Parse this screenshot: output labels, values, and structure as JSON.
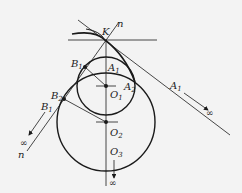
{
  "diagram": {
    "type": "geometry",
    "labels": {
      "K": "K",
      "n_top": "n",
      "n_bottom": "n",
      "A1_small": {
        "base": "A",
        "sub": "1"
      },
      "A2": {
        "base": "A",
        "sub": "2"
      },
      "A1_far": {
        "base": "A",
        "sub": "1"
      },
      "B1_top": {
        "base": "B",
        "sub": "1"
      },
      "B2": {
        "base": "B",
        "sub": "2"
      },
      "B1_far": {
        "base": "B",
        "sub": "1"
      },
      "O1": {
        "base": "O",
        "sub": "1"
      },
      "O2": {
        "base": "O",
        "sub": "2"
      },
      "O3": {
        "base": "O",
        "sub": "3"
      },
      "infinity": "∞"
    },
    "elements": {
      "small_circle": {
        "center": "O1",
        "cx": 106,
        "cy": 86,
        "r": 29
      },
      "large_circle": {
        "center": "O2",
        "cx": 106,
        "cy": 122,
        "r": 49
      },
      "tangent_line": {
        "through": "K"
      },
      "normal_line": {
        "label": "n-n"
      },
      "vertical_axis": {
        "from": "K",
        "to": "O3 → ∞"
      }
    },
    "colors": {
      "stroke": "#1a1a1a",
      "background": "#f3f3f3"
    }
  }
}
